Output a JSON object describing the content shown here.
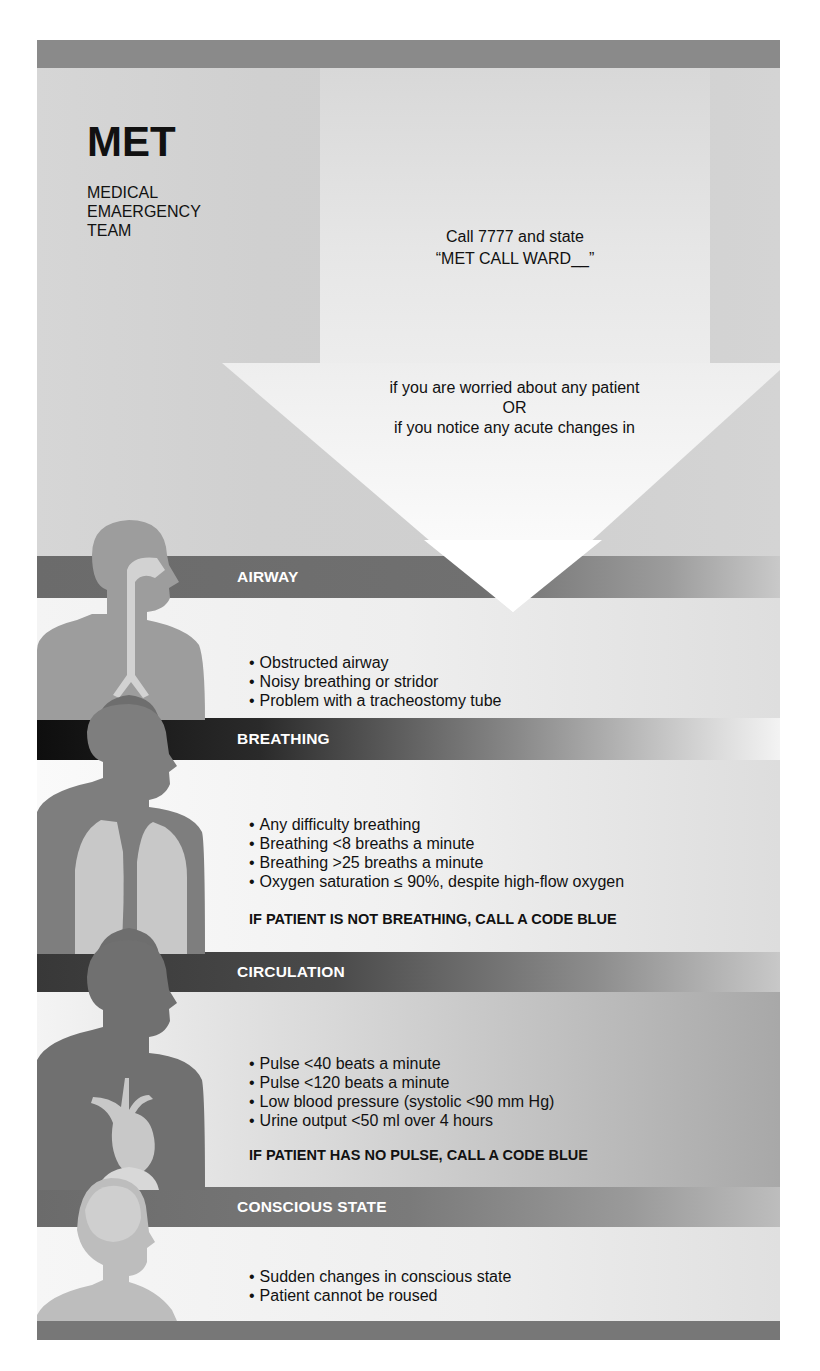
{
  "header": {
    "title": "MET",
    "subtitle_lines": [
      "MEDICAL",
      "EMAERGENCY",
      "TEAM"
    ],
    "call_line1": "Call 7777 and state",
    "call_line2": "“MET CALL WARD__”",
    "condition_line1": "if you are worried about any patient",
    "condition_or": "OR",
    "condition_line2": "if you notice any acute changes in"
  },
  "sections": [
    {
      "label": "AIRWAY",
      "icon": "airway-figure-icon",
      "criteria": [
        "Obstructed airway",
        "Noisy breathing or stridor",
        "Problem with a tracheostomy tube"
      ]
    },
    {
      "label": "BREATHING",
      "icon": "lungs-figure-icon",
      "criteria": [
        "Any difficulty breathing",
        "Breathing <8 breaths a minute",
        "Breathing >25 breaths a minute",
        "Oxygen saturation ≤ 90%, despite high-flow oxygen"
      ],
      "warning": "IF PATIENT IS NOT BREATHING, CALL A CODE BLUE"
    },
    {
      "label": "CIRCULATION",
      "icon": "heart-figure-icon",
      "criteria": [
        "Pulse <40 beats a minute",
        "Pulse <120 beats a minute",
        "Low blood pressure (systolic <90 mm Hg)",
        "Urine output <50 ml over 4 hours"
      ],
      "warning": "IF PATIENT HAS NO PULSE, CALL A CODE BLUE"
    },
    {
      "label": "CONSCIOUS STATE",
      "icon": "brain-figure-icon",
      "criteria": [
        "Sudden changes in conscious state",
        "Patient cannot be roused"
      ]
    }
  ],
  "colors": {
    "poster_bg": "#d9d9d9",
    "top_bar": "#8a8a8a",
    "arrow": "#ffffff",
    "text": "#111111",
    "bar_text": "#ffffff"
  }
}
